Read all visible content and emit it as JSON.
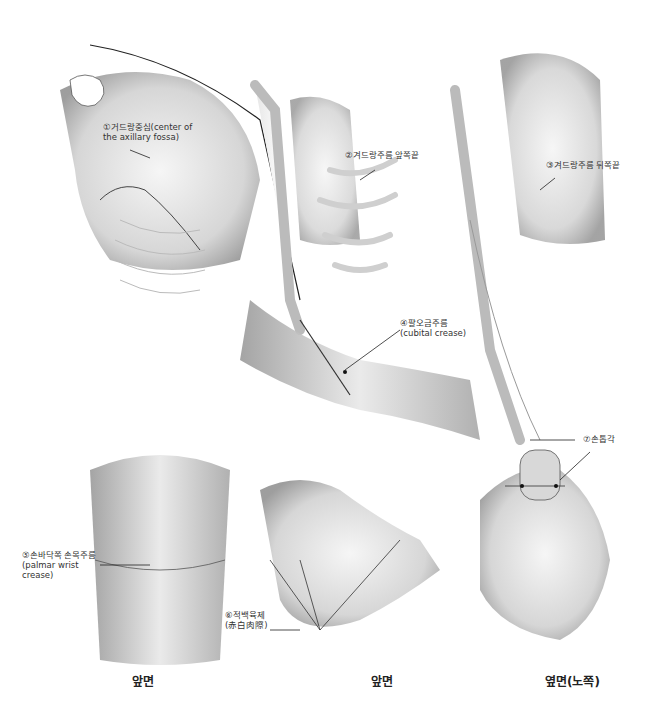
{
  "figure": {
    "type": "anatomical-illustration",
    "panels": [
      {
        "id": "upper-left",
        "view": "front chest/shoulder"
      },
      {
        "id": "upper-middle",
        "view": "front arm skeleton"
      },
      {
        "id": "upper-right",
        "view": "side arm skeleton"
      },
      {
        "id": "lower-left",
        "view": "wrist front"
      },
      {
        "id": "lower-middle",
        "view": "hand palm front"
      },
      {
        "id": "lower-right",
        "view": "hand side (thumb)"
      }
    ]
  },
  "labels": {
    "l1": {
      "main": "①거드랑중심(center of",
      "sub": "the axillary fossa)"
    },
    "l2": {
      "main": "②겨드랑주름 앞쪽끝"
    },
    "l3": {
      "main": "③겨드랑주름 뒤쪽끝"
    },
    "l4": {
      "main": "④팔오금주름",
      "sub": "(cubital crease)"
    },
    "l5": {
      "main": "⑤손바닥쪽 손목주름",
      "sub1": "(palmar wrist",
      "sub2": "crease)"
    },
    "l6": {
      "main": "⑥적백육제",
      "sub": "(赤白肉際)"
    },
    "l7": {
      "main": "⑦손톱각"
    }
  },
  "captions": {
    "left": "앞면",
    "middle": "앞면",
    "right": "옆면(노쪽)"
  }
}
